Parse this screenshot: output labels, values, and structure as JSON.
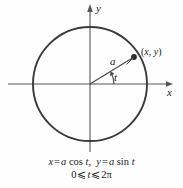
{
  "figure": {
    "background_color": "#fefefe",
    "stroke_color": "#3a3a3a",
    "axis_color": "#555555"
  },
  "axes": {
    "x_label": "x",
    "y_label": "x_label_unused",
    "y_axis_label": "y",
    "origin": {
      "x": 90,
      "y": 84
    }
  },
  "circle": {
    "center_x": 90,
    "center_y": 84,
    "radius": 57,
    "radius_label": "a"
  },
  "angle": {
    "label": "t",
    "degrees": 28
  },
  "point": {
    "label": "(x, y)",
    "open_paren": "(",
    "x_text": "x",
    "comma": ", ",
    "y_text": "y",
    "close_paren": ")",
    "px": 134,
    "py": 57
  },
  "caption": {
    "line1": {
      "x_var": "x",
      "eq1": "=",
      "a1": "a",
      "cos": "cos",
      "t1": "t",
      "comma": ",",
      "y_var": "y",
      "eq2": "=",
      "a2": "a",
      "sin": "sin",
      "t2": "t",
      "full": "x = a cos t,  y = a sin t"
    },
    "line2": {
      "zero": "0",
      "le1": "⩽",
      "t": "t",
      "le2": "⩽",
      "two_pi": "2π",
      "full": "0 ⩽ t ⩽ 2π"
    }
  }
}
